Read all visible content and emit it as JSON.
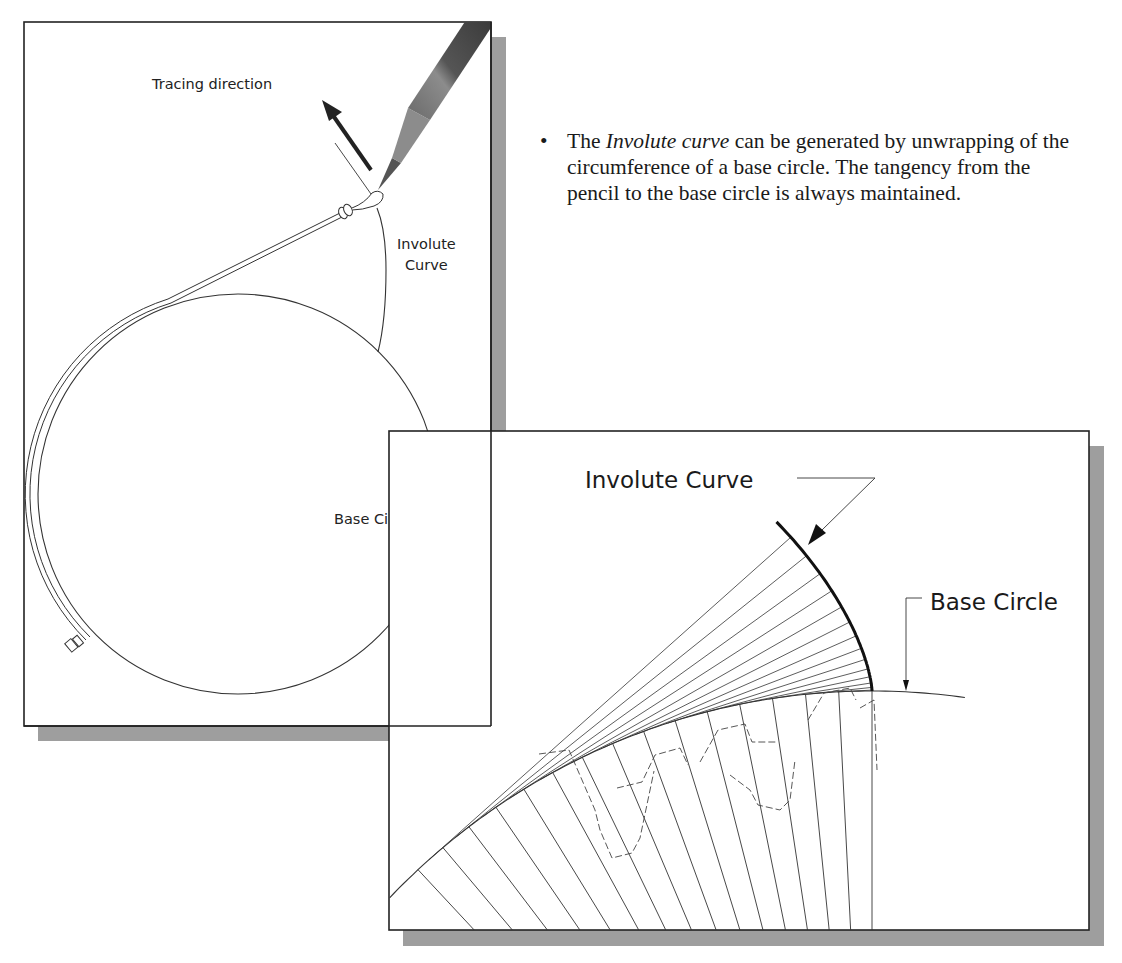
{
  "left_panel": {
    "labels": {
      "tracing_direction": "Tracing direction",
      "involute_line1": "Involute",
      "involute_line2": "Curve",
      "base_circle": "Base Circle"
    }
  },
  "right_panel": {
    "labels": {
      "involute_curve": "Involute Curve",
      "base_circle": "Base Circle"
    }
  },
  "description": {
    "bullet": "•",
    "prefix": "The ",
    "emphasis": "Involute curve",
    "suffix": " can be generated by unwrapping of the circumference of a base circle. The tangency from the pencil to the base circle is always maintained."
  },
  "colors": {
    "line": "#222222",
    "shadow": "#9a9a9a",
    "pencil_dark": "#3a3a3a",
    "pencil_light": "#8a8a8a"
  }
}
